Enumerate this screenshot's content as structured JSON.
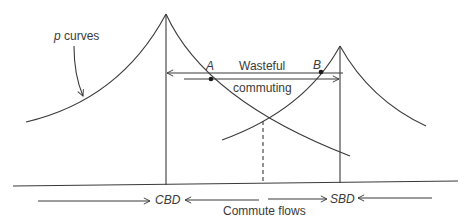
{
  "diagram": {
    "curve_label_var": "p",
    "curve_label_text": " curves",
    "point_a": "A",
    "point_b": "B",
    "wasteful_line1": "Wasteful",
    "wasteful_line2": "commuting",
    "cbd": "CBD",
    "sbd": "SBD",
    "flows_caption": "Commute flows",
    "colors": {
      "line": "#3a3a3a",
      "background": "#ffffff"
    }
  }
}
